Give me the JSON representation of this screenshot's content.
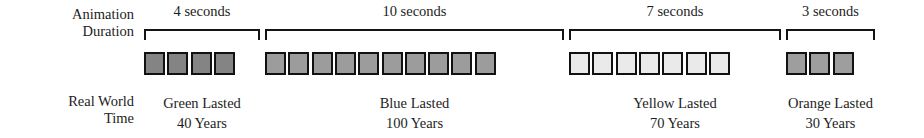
{
  "figure": {
    "row_labels": {
      "animation_duration": [
        "Animation",
        "Duration"
      ],
      "real_world_time": [
        "Real World",
        "Time"
      ]
    },
    "strip": {
      "left": 144,
      "top": 52,
      "cell_width": 21,
      "cell_height": 23,
      "cell_pitch": 23.3,
      "border_color": "#111111"
    },
    "groups": [
      {
        "id": "green",
        "duration_label": "4 seconds",
        "duration_seconds": 4,
        "real_world_line1": "Green Lasted",
        "real_world_line2": "40 Years",
        "real_world_years": 40,
        "cell_count": 4,
        "fill_color": "#848484",
        "start_x": 144,
        "width": 116
      },
      {
        "id": "blue",
        "duration_label": "10 seconds",
        "duration_seconds": 10,
        "real_world_line1": "Blue Lasted",
        "real_world_line2": "100 Years",
        "real_world_years": 100,
        "cell_count": 10,
        "fill_color": "#9c9c9c",
        "start_x": 265,
        "width": 299
      },
      {
        "id": "yellow",
        "duration_label": "7 seconds",
        "duration_seconds": 7,
        "real_world_line1": "Yellow Lasted",
        "real_world_line2": "70 Years",
        "real_world_years": 70,
        "cell_count": 7,
        "fill_color": "#eaeaea",
        "start_x": 569,
        "width": 212
      },
      {
        "id": "orange",
        "duration_label": "3 seconds",
        "duration_seconds": 3,
        "real_world_line1": "Orange Lasted",
        "real_world_line2": "30 Years",
        "real_world_years": 30,
        "cell_count": 3,
        "fill_color": "#9e9e9e",
        "start_x": 786,
        "width": 89
      }
    ]
  },
  "chart_data": {
    "type": "table",
    "title": "",
    "categories": [
      "Green",
      "Blue",
      "Yellow",
      "Orange"
    ],
    "series": [
      {
        "name": "Animation Duration (seconds)",
        "values": [
          4,
          10,
          7,
          3
        ]
      },
      {
        "name": "Real World Time (years)",
        "values": [
          40,
          100,
          70,
          30
        ]
      }
    ],
    "xlabel": "",
    "ylabel": "",
    "annotations": [
      "4 seconds",
      "10 seconds",
      "7 seconds",
      "3 seconds",
      "Green Lasted 40 Years",
      "Blue Lasted 100 Years",
      "Yellow Lasted 70 Years",
      "Orange Lasted 30 Years"
    ]
  }
}
